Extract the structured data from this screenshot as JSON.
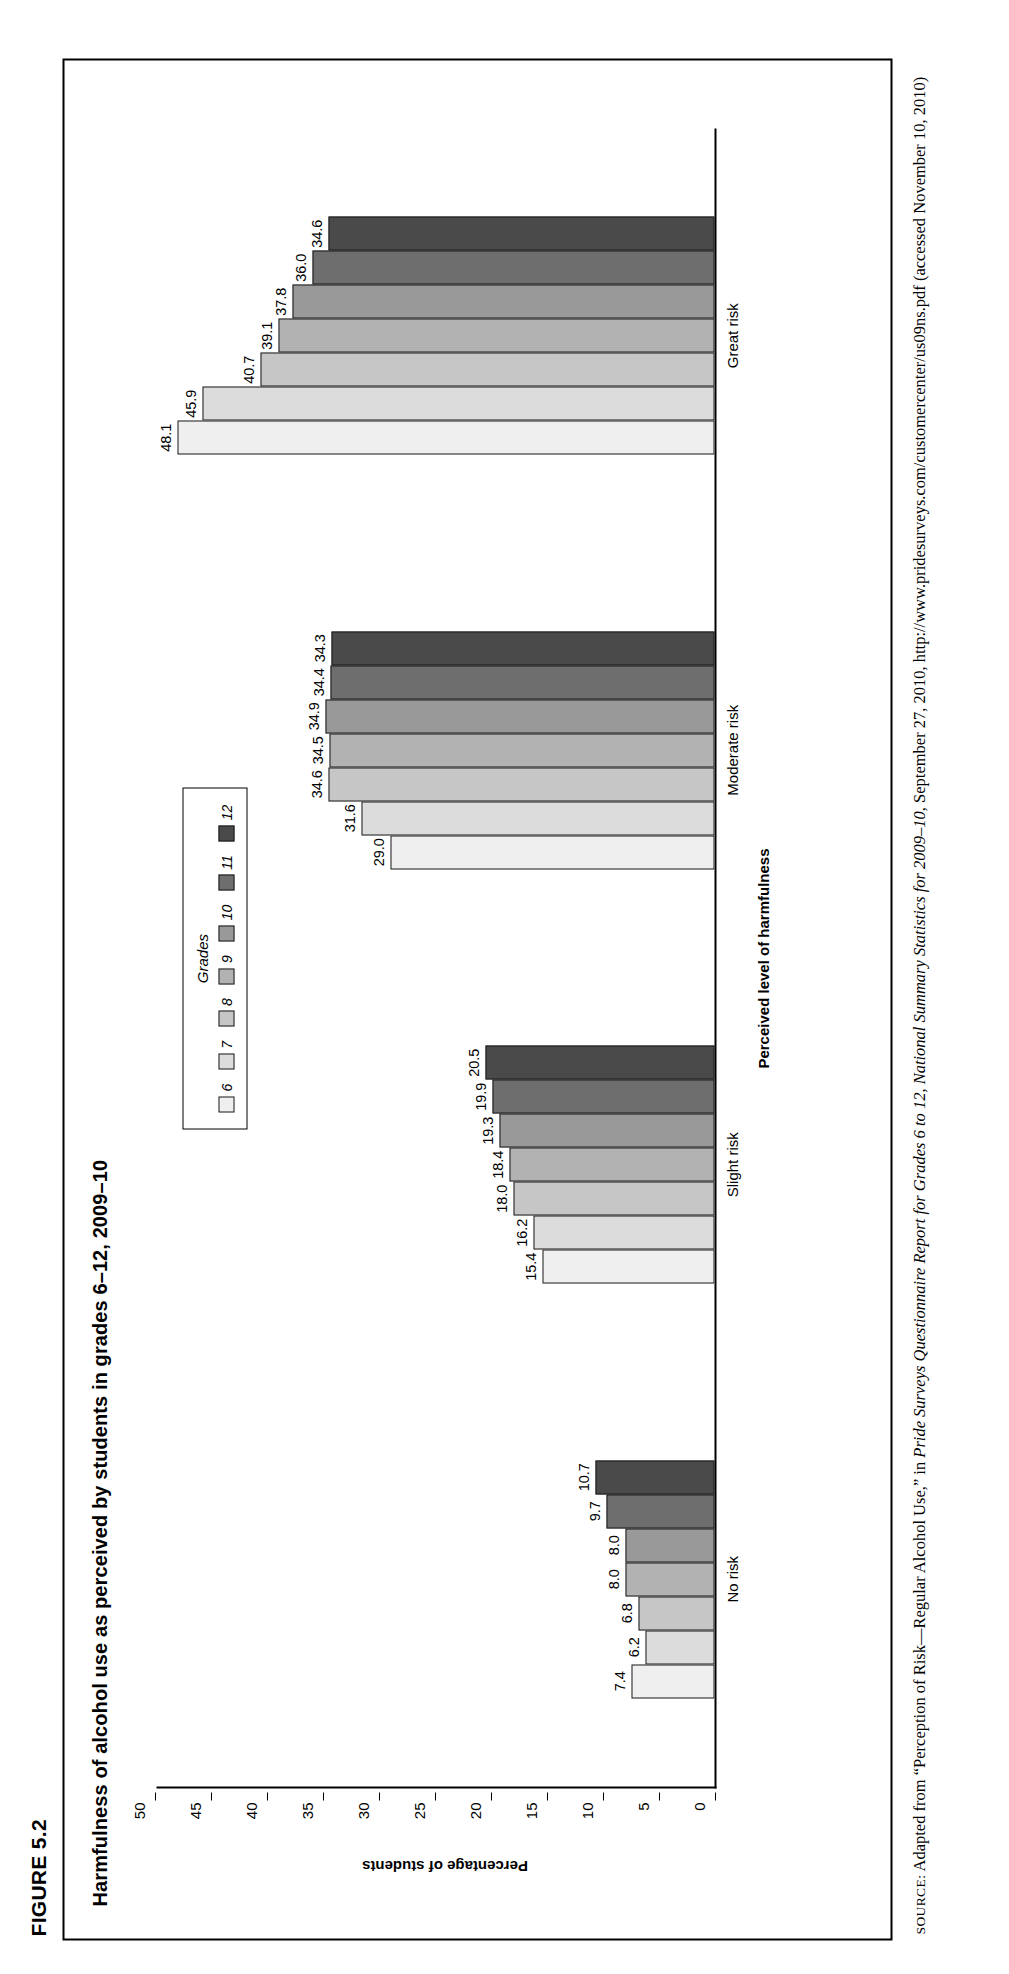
{
  "figure": {
    "number": "FIGURE 5.2",
    "title": "Harmfulness of alcohol use as perceived by students in grades 6–12, 2009–10"
  },
  "source": {
    "label": "SOURCE:",
    "text_part1": "Adapted from “Perception of Risk—Regular Alcohol Use,” in ",
    "italic_part": "Pride Surveys Questionnaire Report for Grades 6 to 12, National Summary Statistics for 2009–10",
    "text_part2": ", September 27, 2010, http://www.pridesurveys.com/customercenter/us09ns.pdf (accessed November 10, 2010)"
  },
  "legend": {
    "title": "Grades",
    "items": [
      {
        "label": "6",
        "color": "#efefef"
      },
      {
        "label": "7",
        "color": "#dcdcdc"
      },
      {
        "label": "8",
        "color": "#c6c6c6"
      },
      {
        "label": "9",
        "color": "#b2b2b2"
      },
      {
        "label": "10",
        "color": "#999999"
      },
      {
        "label": "11",
        "color": "#6e6e6e"
      },
      {
        "label": "12",
        "color": "#4a4a4a"
      }
    ]
  },
  "chart_data": {
    "type": "bar",
    "title": "Harmfulness of alcohol use as perceived by students in grades 6–12, 2009–10",
    "xlabel": "Perceived level of harmfulness",
    "ylabel": "Percentage of students",
    "ylim": [
      0,
      50
    ],
    "yticks": [
      0,
      5,
      10,
      15,
      20,
      25,
      30,
      35,
      40,
      45,
      50
    ],
    "grid": false,
    "legend_position": "top-center",
    "categories": [
      "No risk",
      "Slight risk",
      "Moderate risk",
      "Great risk"
    ],
    "series": [
      {
        "name": "6",
        "values": [
          7.4,
          15.4,
          29.0,
          48.1
        ]
      },
      {
        "name": "7",
        "values": [
          6.2,
          16.2,
          31.6,
          45.9
        ]
      },
      {
        "name": "8",
        "values": [
          6.8,
          18.0,
          34.6,
          40.7
        ]
      },
      {
        "name": "9",
        "values": [
          8.0,
          18.4,
          34.5,
          39.1
        ]
      },
      {
        "name": "10",
        "values": [
          8.0,
          19.3,
          34.9,
          37.8
        ]
      },
      {
        "name": "11",
        "values": [
          9.7,
          19.9,
          34.4,
          36.0
        ]
      },
      {
        "name": "12",
        "values": [
          10.7,
          20.5,
          34.3,
          34.6
        ]
      }
    ]
  }
}
